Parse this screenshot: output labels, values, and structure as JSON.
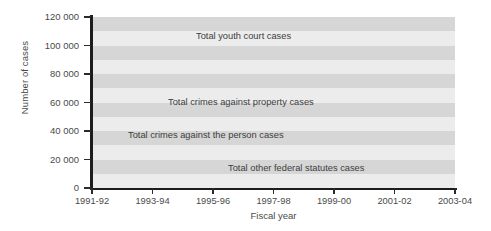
{
  "chart_data": {
    "type": "line",
    "title": "",
    "xlabel": "Fiscal year",
    "ylabel": "Number of cases",
    "x": [
      "1991-92",
      "1992-93",
      "1993-94",
      "1994-95",
      "1995-96",
      "1996-97",
      "1997-98",
      "1998-99",
      "1999-00",
      "2000-01",
      "2001-02",
      "2002-03",
      "2003-04"
    ],
    "xtick_labels": [
      "1991-92",
      "1993-94",
      "1995-96",
      "1997-98",
      "1999-00",
      "2001-02",
      "2003-04"
    ],
    "ytick_labels": [
      "0",
      "20 000",
      "40 000",
      "60 000",
      "80 000",
      "100 000",
      "120 000"
    ],
    "ytick_values": [
      0,
      20000,
      40000,
      60000,
      80000,
      100000,
      120000
    ],
    "ylim": [
      0,
      120000
    ],
    "grid": "alternating-horizontal-bands",
    "legend": "inline-labels",
    "series": [
      {
        "name": "Total youth court cases",
        "style": "solid",
        "color": "#6f6f6f",
        "width": 1.8,
        "values": [
          107000,
          104000,
          101000,
          101500,
          102500,
          99000,
          96500,
          95500,
          95500,
          95000,
          96000,
          95000,
          73000
        ]
      },
      {
        "name": "Total crimes against property cases",
        "style": "dashed",
        "color": "#1d1d1d",
        "width": 2.0,
        "values": [
          61000,
          58500,
          54000,
          50000,
          47500,
          46000,
          45000,
          41500,
          40000,
          39000,
          38500,
          37500,
          28000
        ]
      },
      {
        "name": "Total crimes against the person cases",
        "style": "solid",
        "color": "#1d1d1d",
        "width": 1.4,
        "values": [
          18000,
          19500,
          20500,
          21500,
          22000,
          22000,
          22000,
          22000,
          22000,
          22500,
          22500,
          22000,
          21000
        ]
      },
      {
        "name": "Total other federal statutes cases",
        "style": "dashed-fine",
        "color": "#1d1d1d",
        "width": 1.6,
        "values": [
          11000,
          11200,
          11800,
          12800,
          13500,
          13800,
          14000,
          14200,
          14500,
          15000,
          15500,
          15000,
          13000
        ]
      }
    ],
    "bands": [
      {
        "from": 0,
        "to": 10000,
        "shade": "#ececec"
      },
      {
        "from": 10000,
        "to": 20000,
        "shade": "#d6d6d6"
      },
      {
        "from": 20000,
        "to": 30000,
        "shade": "#ececec"
      },
      {
        "from": 30000,
        "to": 40000,
        "shade": "#d6d6d6"
      },
      {
        "from": 40000,
        "to": 50000,
        "shade": "#ececec"
      },
      {
        "from": 50000,
        "to": 60000,
        "shade": "#d6d6d6"
      },
      {
        "from": 60000,
        "to": 70000,
        "shade": "#ececec"
      },
      {
        "from": 70000,
        "to": 80000,
        "shade": "#d6d6d6"
      },
      {
        "from": 80000,
        "to": 90000,
        "shade": "#ececec"
      },
      {
        "from": 90000,
        "to": 100000,
        "shade": "#d6d6d6"
      },
      {
        "from": 100000,
        "to": 110000,
        "shade": "#ececec"
      },
      {
        "from": 110000,
        "to": 120000,
        "shade": "#d6d6d6"
      }
    ]
  },
  "labels": {
    "series_youth": "Total youth court cases",
    "series_property": "Total crimes against property cases",
    "series_person": "Total crimes against the person cases",
    "series_federal": "Total other federal statutes cases",
    "y_title": "Number of cases",
    "x_title": "Fiscal year"
  }
}
